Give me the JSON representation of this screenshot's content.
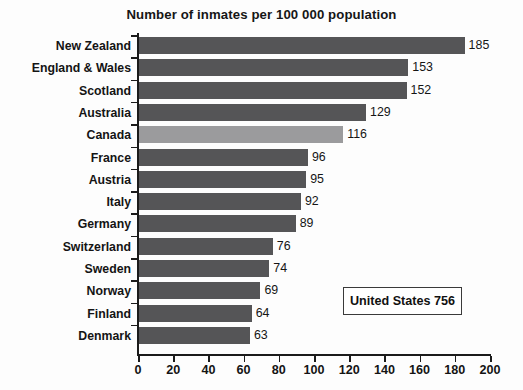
{
  "chart_data": {
    "type": "bar",
    "orientation": "horizontal",
    "title": "Number of inmates per 100 000 population",
    "xlabel": "",
    "ylabel": "",
    "xlim": [
      0,
      200
    ],
    "xticks": [
      0,
      20,
      40,
      60,
      80,
      100,
      120,
      140,
      160,
      180,
      200
    ],
    "grid": false,
    "legend": null,
    "categories": [
      "New Zealand",
      "England & Wales",
      "Scotland",
      "Australia",
      "Canada",
      "France",
      "Austria",
      "Italy",
      "Germany",
      "Switzerland",
      "Sweden",
      "Norway",
      "Finland",
      "Denmark"
    ],
    "values": [
      185,
      153,
      152,
      129,
      116,
      96,
      95,
      92,
      89,
      76,
      74,
      69,
      64,
      63
    ],
    "highlight_category": "Canada",
    "bar_color": "#555557",
    "highlight_color": "#9b9b9d",
    "annotations": [
      {
        "name": "united-states-callout",
        "text": "United States 756",
        "label": "United States",
        "value": 756
      }
    ]
  },
  "axis": {
    "tick_labels": [
      "0",
      "20",
      "40",
      "60",
      "80",
      "100",
      "120",
      "140",
      "160",
      "180",
      "200"
    ]
  },
  "rows": [
    {
      "label": "New Zealand",
      "value": 185,
      "value_text": "185",
      "highlight": false
    },
    {
      "label": "England & Wales",
      "value": 153,
      "value_text": "153",
      "highlight": false
    },
    {
      "label": "Scotland",
      "value": 152,
      "value_text": "152",
      "highlight": false
    },
    {
      "label": "Australia",
      "value": 129,
      "value_text": "129",
      "highlight": false
    },
    {
      "label": "Canada",
      "value": 116,
      "value_text": "116",
      "highlight": true
    },
    {
      "label": "France",
      "value": 96,
      "value_text": "96",
      "highlight": false
    },
    {
      "label": "Austria",
      "value": 95,
      "value_text": "95",
      "highlight": false
    },
    {
      "label": "Italy",
      "value": 92,
      "value_text": "92",
      "highlight": false
    },
    {
      "label": "Germany",
      "value": 89,
      "value_text": "89",
      "highlight": false
    },
    {
      "label": "Switzerland",
      "value": 76,
      "value_text": "76",
      "highlight": false
    },
    {
      "label": "Sweden",
      "value": 74,
      "value_text": "74",
      "highlight": false
    },
    {
      "label": "Norway",
      "value": 69,
      "value_text": "69",
      "highlight": false
    },
    {
      "label": "Finland",
      "value": 64,
      "value_text": "64",
      "highlight": false
    },
    {
      "label": "Denmark",
      "value": 63,
      "value_text": "63",
      "highlight": false
    }
  ],
  "callout": {
    "text": "United States 756"
  }
}
